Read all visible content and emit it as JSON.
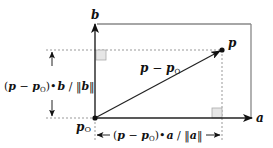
{
  "diagram": {
    "type": "vector-projection",
    "axes": {
      "a_label": "a",
      "b_label": "b"
    },
    "points": {
      "origin_label": "p",
      "origin_subscript": "O",
      "point_label": "p"
    },
    "vector": {
      "label_main": "p",
      "label_minus": " − ",
      "label_second": "p",
      "label_subscript": "O"
    },
    "projections": {
      "b_projection": {
        "open_paren": "(",
        "p": "p",
        "minus": " − ",
        "p0": "p",
        "p0_sub": "O",
        "close_paren": ")",
        "dot": "•",
        "axis": "b",
        "slash": " / ",
        "norm_open": "‖",
        "norm_axis": "b",
        "norm_close": "‖"
      },
      "a_projection": {
        "open_paren": "(",
        "p": "p",
        "minus": " − ",
        "p0": "p",
        "p0_sub": "O",
        "close_paren": ")",
        "dot": "•",
        "axis": "a",
        "slash": " / ",
        "norm_open": "‖",
        "norm_axis": "a",
        "norm_close": "‖"
      }
    },
    "colors": {
      "line": "#222222",
      "frame": "#888888",
      "dotted": "#999999",
      "right_angle_fill": "#e6e6e6",
      "right_angle_stroke": "#aaaaaa"
    }
  }
}
